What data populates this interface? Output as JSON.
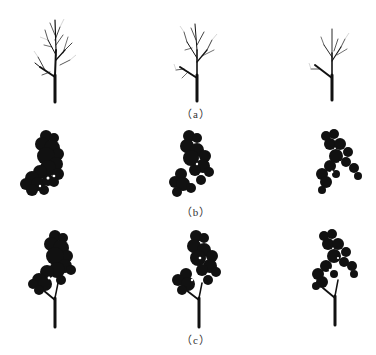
{
  "figure": {
    "rows": [
      {
        "id": "a",
        "label": "（a）",
        "description": "branch skeletons",
        "items": [
          "tree-1",
          "tree-2",
          "tree-3"
        ]
      },
      {
        "id": "b",
        "label": "（b）",
        "description": "leaf clusters",
        "items": [
          "tree-1",
          "tree-2",
          "tree-3"
        ]
      },
      {
        "id": "c",
        "label": "（c）",
        "description": "complete trees",
        "items": [
          "tree-1",
          "tree-2",
          "tree-3"
        ]
      }
    ],
    "colors": {
      "ink": "#111111",
      "background": "#ffffff",
      "label": "#333333"
    }
  }
}
